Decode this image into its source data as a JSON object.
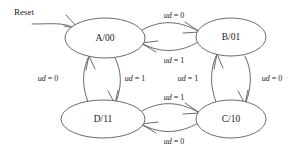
{
  "diagram": {
    "type": "state-transition-diagram",
    "title": "",
    "background_color": "#ffffff",
    "line_color": "#5a5a5a",
    "text_color": "#1b1b1b",
    "reset": {
      "label": "Reset",
      "target_state": "A/00"
    },
    "states": [
      {
        "id": "A",
        "label": "A/00",
        "cx": 105,
        "cy": 38,
        "rx": 40,
        "ry": 20
      },
      {
        "id": "B",
        "label": "B/01",
        "cx": 231,
        "cy": 37,
        "rx": 35,
        "ry": 19
      },
      {
        "id": "D",
        "label": "D/11",
        "cx": 103,
        "cy": 119,
        "rx": 42,
        "ry": 19
      },
      {
        "id": "C",
        "label": "C/10",
        "cx": 231,
        "cy": 119,
        "rx": 35,
        "ry": 19
      }
    ],
    "transitions": [
      {
        "from": "A",
        "to": "B",
        "condition_var": "ud",
        "condition_value": "0",
        "label_prefix": "ud",
        "label_suffix": " = 0",
        "label_x": 172,
        "label_y": 16
      },
      {
        "from": "B",
        "to": "A",
        "condition_var": "ud",
        "condition_value": "1",
        "label_prefix": "ud",
        "label_suffix": " = 1",
        "label_x": 172,
        "label_y": 61
      },
      {
        "from": "D",
        "to": "A",
        "condition_var": "ud",
        "condition_value": "0",
        "label_prefix": "ud",
        "label_suffix": " = 0",
        "label_x": 46,
        "label_y": 79
      },
      {
        "from": "A",
        "to": "D",
        "condition_var": "ud",
        "condition_value": "1",
        "label_prefix": "ud",
        "label_suffix": " = 1",
        "label_x": 133,
        "label_y": 79
      },
      {
        "from": "C",
        "to": "B",
        "condition_var": "ud",
        "condition_value": "1",
        "label_prefix": "ud",
        "label_suffix": " = 1",
        "label_x": 186,
        "label_y": 79
      },
      {
        "from": "B",
        "to": "C",
        "condition_var": "ud",
        "condition_value": "0",
        "label_prefix": "ud",
        "label_suffix": " = 0",
        "label_x": 270,
        "label_y": 79
      },
      {
        "from": "D",
        "to": "C",
        "condition_var": "ud",
        "condition_value": "1",
        "label_prefix": "ud",
        "label_suffix": " = 1",
        "label_x": 172,
        "label_y": 98
      },
      {
        "from": "C",
        "to": "D",
        "condition_var": "ud",
        "condition_value": "0",
        "label_prefix": "ud",
        "label_suffix": " = 0",
        "label_x": 172,
        "label_y": 142
      }
    ]
  }
}
